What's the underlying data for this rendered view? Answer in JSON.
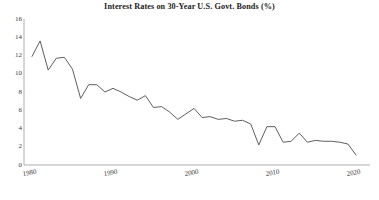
{
  "chart_data": {
    "type": "line",
    "title": "Interest Rates on 30-Year U.S. Govt. Bonds (%)",
    "xlabel": "",
    "ylabel": "",
    "xlim": [
      1980,
      2020
    ],
    "ylim": [
      0,
      16
    ],
    "grid": false,
    "legend": false,
    "line_color": "#555555",
    "axis_color": "#9a9a9a",
    "ytick_labels": [
      "0",
      "2",
      "4",
      "6",
      "8",
      "10",
      "12",
      "14",
      "16"
    ],
    "ytick_values": [
      0,
      2,
      4,
      6,
      8,
      10,
      12,
      14,
      16
    ],
    "xtick_labels": [
      "1980",
      "1990",
      "2000",
      "2010",
      "2020"
    ],
    "xtick_values": [
      1980,
      1990,
      2000,
      2010,
      2020
    ],
    "series": [
      {
        "name": "30-Year U.S. Govt. Bond Rate",
        "x": [
          1980,
          1981,
          1982,
          1983,
          1984,
          1985,
          1986,
          1987,
          1988,
          1989,
          1990,
          1991,
          1992,
          1993,
          1994,
          1995,
          1996,
          1997,
          1998,
          1999,
          2000,
          2001,
          2002,
          2003,
          2004,
          2005,
          2006,
          2007,
          2008,
          2009,
          2010,
          2011,
          2012,
          2013,
          2014,
          2015,
          2016,
          2017,
          2018,
          2019,
          2020
        ],
        "values": [
          11.9,
          13.6,
          10.4,
          11.7,
          11.8,
          10.5,
          7.3,
          8.8,
          8.8,
          8.0,
          8.4,
          8.0,
          7.5,
          7.1,
          7.6,
          6.3,
          6.4,
          5.8,
          5.0,
          5.6,
          6.2,
          5.2,
          5.3,
          5.0,
          5.1,
          4.8,
          4.9,
          4.5,
          2.2,
          4.2,
          4.2,
          2.5,
          2.6,
          3.5,
          2.5,
          2.7,
          2.6,
          2.6,
          2.5,
          2.3,
          1.1
        ]
      }
    ],
    "caption": ""
  }
}
